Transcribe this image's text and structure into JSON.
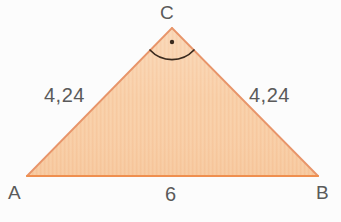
{
  "figure": {
    "kind": "geometry-diagram",
    "shape": "right-isosceles-triangle",
    "background_color": "#fcfcfc",
    "fill_color": "#f7c9a0",
    "fill_color_light": "#fadcc0",
    "stroke_color": "#e8956a",
    "marker_color": "#3a2a1e",
    "text_color": "#5a5a5a"
  },
  "vertices": {
    "c": {
      "label": "C",
      "x": 172,
      "y": 28
    },
    "a": {
      "label": "A",
      "x": 27,
      "y": 176
    },
    "b": {
      "label": "B",
      "x": 318,
      "y": 176
    }
  },
  "sides": {
    "ac": {
      "label": "4,24"
    },
    "bc": {
      "label": "4,24"
    },
    "ab": {
      "label": "6"
    }
  },
  "angle_marker": {
    "at_vertex": "C",
    "type": "right-angle-arc-with-dot",
    "name": "right-angle-marker"
  }
}
